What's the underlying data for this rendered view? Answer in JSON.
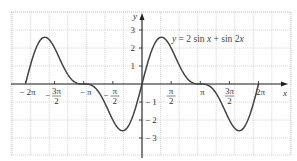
{
  "chart_data": {
    "type": "line",
    "title": "",
    "function": "y = 2 sin x + sin 2x",
    "annotation": "y = 2 sin x + sin 2x",
    "xlabel": "x",
    "ylabel": "y",
    "xlim": [
      -7.1,
      7.85
    ],
    "ylim": [
      -3.95,
      4.0
    ],
    "x_domain": [
      -6.2832,
      6.2832
    ],
    "grid": true,
    "legend": "none",
    "x_ticks": [
      {
        "value": -6.2832,
        "label": "− 2π",
        "num": "− 2π",
        "den": ""
      },
      {
        "value": -4.7124,
        "label": "− 3π/2",
        "num": "3π",
        "den": "2",
        "sign": "−"
      },
      {
        "value": -3.1416,
        "label": "− π",
        "num": "− π",
        "den": ""
      },
      {
        "value": -1.5708,
        "label": "− π/2",
        "num": "π",
        "den": "2",
        "sign": "−"
      },
      {
        "value": 1.5708,
        "label": "π/2",
        "num": "π",
        "den": "2"
      },
      {
        "value": 3.1416,
        "label": "π",
        "num": "π",
        "den": ""
      },
      {
        "value": 4.7124,
        "label": "3π/2",
        "num": "3π",
        "den": "2"
      },
      {
        "value": 6.2832,
        "label": "2π",
        "num": "2π",
        "den": ""
      }
    ],
    "y_ticks": [
      {
        "value": 3,
        "label": "3"
      },
      {
        "value": 2,
        "label": "2"
      },
      {
        "value": 1,
        "label": "1"
      },
      {
        "value": -1,
        "label": "− 1"
      },
      {
        "value": -2,
        "label": "− 2"
      },
      {
        "value": -3,
        "label": "− 3"
      }
    ],
    "key_points": [
      {
        "x": -6.2832,
        "y": 0
      },
      {
        "x": -5.236,
        "y": 2.598,
        "note": "local max"
      },
      {
        "x": -3.1416,
        "y": 0
      },
      {
        "x": -1.0472,
        "y": -2.598,
        "note": "local min"
      },
      {
        "x": 0,
        "y": 0
      },
      {
        "x": 1.0472,
        "y": 2.598,
        "note": "local max"
      },
      {
        "x": 3.1416,
        "y": 0
      },
      {
        "x": 5.236,
        "y": -2.598,
        "note": "local min"
      },
      {
        "x": 6.2832,
        "y": 0
      }
    ]
  },
  "colors": {
    "curve": "#444444",
    "axis": "#222222",
    "grid": "#c9c9c9",
    "background": "#ffffff"
  },
  "labels": {
    "x_axis": "x",
    "y_axis": "y",
    "equation_y": "y",
    "equation_rest": " = 2 sin ",
    "equation_x1": "x",
    "equation_mid": " + sin 2",
    "equation_x2": "x"
  }
}
